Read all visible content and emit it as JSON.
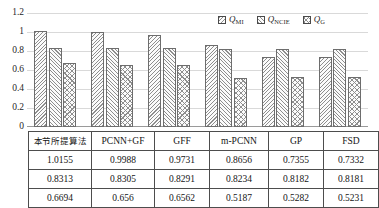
{
  "chart_data": {
    "type": "bar",
    "title": "",
    "xlabel": "",
    "ylabel": "",
    "ylim": [
      0,
      1.2
    ],
    "grid": true,
    "legend_position": "top-right",
    "categories": [
      "本节所提算法",
      "PCNN+GF",
      "GFF",
      "m-PCNN",
      "GP",
      "FSD"
    ],
    "yticks": [
      "0",
      "0.2",
      "0.4",
      "0.6",
      "0.8",
      "1",
      "1.2"
    ],
    "ytick_values": [
      0,
      0.2,
      0.4,
      0.6,
      0.8,
      1,
      1.2
    ],
    "series": [
      {
        "name": "QMI",
        "label_main": "Q",
        "label_sub": "MI",
        "pattern": "diagonal-back-hatch",
        "values": [
          1.0155,
          0.9988,
          0.9731,
          0.8656,
          0.7355,
          0.7332
        ]
      },
      {
        "name": "QNCIE",
        "label_main": "Q",
        "label_sub": "NCIE",
        "pattern": "diagonal-forward-hatch",
        "values": [
          0.8313,
          0.8305,
          0.8291,
          0.8234,
          0.8182,
          0.8181
        ]
      },
      {
        "name": "QG",
        "label_main": "Q",
        "label_sub": "G",
        "pattern": "cross-hatch",
        "values": [
          0.6694,
          0.656,
          0.6562,
          0.5187,
          0.5282,
          0.5231
        ]
      }
    ],
    "table": {
      "header": [
        "本节所提算法",
        "PCNN+GF",
        "GFF",
        "m-PCNN",
        "GP",
        "FSD"
      ],
      "rows": [
        [
          "1.0155",
          "0.9988",
          "0.9731",
          "0.8656",
          "0.7355",
          "0.7332"
        ],
        [
          "0.8313",
          "0.8305",
          "0.8291",
          "0.8234",
          "0.8182",
          "0.8181"
        ],
        [
          "0.6694",
          "0.656",
          "0.6562",
          "0.5187",
          "0.5282",
          "0.5231"
        ]
      ]
    },
    "colors": {
      "bar_outline": "#6d6d6d",
      "hatch": "#8e8e8e",
      "gridline": "#d9d9d9",
      "table_border": "#4d4d4d",
      "text": "#1a1a1a"
    }
  }
}
